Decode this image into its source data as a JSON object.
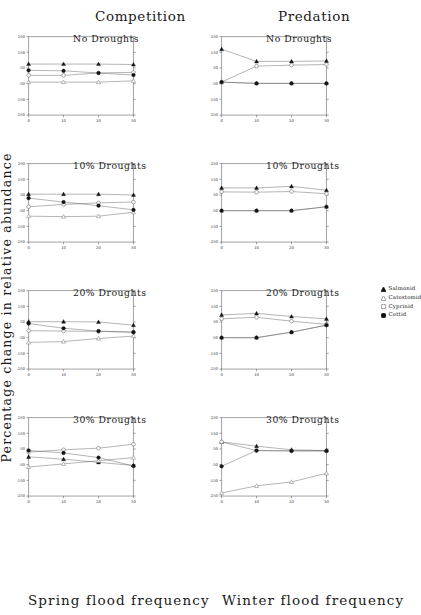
{
  "figure": {
    "ylabel": "Percentage change in relative abundance",
    "columns": [
      {
        "title": "Competition",
        "xlabel": "Spring flood frequency"
      },
      {
        "title": "Predation",
        "xlabel": "Winter flood frequency"
      }
    ],
    "row_titles": [
      "No Droughts",
      "10% Droughts",
      "20% Droughts",
      "30% Droughts"
    ],
    "yticks": [
      "250",
      "150",
      "50",
      "-50",
      "-150",
      "-250"
    ],
    "xticks": [
      "0",
      "10",
      "20",
      "30"
    ],
    "legend": [
      {
        "label": "Salmonid",
        "marker": "filled-triangle"
      },
      {
        "label": "Catostomid",
        "marker": "open-triangle"
      },
      {
        "label": "Cyprinid",
        "marker": "open-circle"
      },
      {
        "label": "Cottid",
        "marker": "filled-circle"
      }
    ]
  },
  "chart_data": {
    "type": "line",
    "xlabel": "Flood frequency",
    "ylabel": "Percentage change in relative abundance",
    "x": [
      0,
      10,
      20,
      30
    ],
    "xlim": [
      0,
      30
    ],
    "ylim": [
      -250,
      250
    ],
    "yticks": [
      250,
      150,
      50,
      -50,
      -150,
      -250
    ],
    "xticks": [
      0,
      10,
      20,
      30
    ],
    "grid": false,
    "legend_position": "right",
    "panels": [
      {
        "column": "Competition",
        "row": "No Droughts",
        "xlabel": "Spring flood frequency",
        "series": [
          {
            "name": "Salmonid",
            "values": [
              75,
              75,
              75,
              72
            ]
          },
          {
            "name": "Catostomid",
            "values": [
              -40,
              -40,
              -40,
              -32
            ]
          },
          {
            "name": "Cyprinid",
            "values": [
              3,
              3,
              18,
              22
            ]
          },
          {
            "name": "Cottid",
            "values": [
              35,
              32,
              18,
              5
            ]
          }
        ]
      },
      {
        "column": "Competition",
        "row": "10% Droughts",
        "xlabel": "Spring flood frequency",
        "series": [
          {
            "name": "Salmonid",
            "values": [
              55,
              55,
              55,
              50
            ]
          },
          {
            "name": "Catostomid",
            "values": [
              -85,
              -88,
              -85,
              -60
            ]
          },
          {
            "name": "Cyprinid",
            "values": [
              -25,
              -10,
              0,
              5
            ]
          },
          {
            "name": "Cottid",
            "values": [
              30,
              5,
              -18,
              -45
            ]
          }
        ]
      },
      {
        "column": "Competition",
        "row": "20% Droughts",
        "xlabel": "Spring flood frequency",
        "series": [
          {
            "name": "Salmonid",
            "values": [
              52,
              52,
              50,
              30
            ]
          },
          {
            "name": "Catostomid",
            "values": [
              -80,
              -75,
              -55,
              -40
            ]
          },
          {
            "name": "Cyprinid",
            "values": [
              -5,
              -8,
              -10,
              -15
            ]
          },
          {
            "name": "Cottid",
            "values": [
              40,
              10,
              -8,
              -15
            ]
          }
        ]
      },
      {
        "column": "Competition",
        "row": "30% Droughts",
        "xlabel": "Spring flood frequency",
        "series": [
          {
            "name": "Salmonid",
            "values": [
              0,
              -15,
              -35,
              -55
            ]
          },
          {
            "name": "Catostomid",
            "values": [
              -65,
              -45,
              -25,
              -5
            ]
          },
          {
            "name": "Cyprinid",
            "values": [
              30,
              45,
              55,
              80
            ]
          },
          {
            "name": "Cottid",
            "values": [
              40,
              25,
              -5,
              -58
            ]
          }
        ]
      },
      {
        "column": "Predation",
        "row": "No Droughts",
        "xlabel": "Winter flood frequency",
        "series": [
          {
            "name": "Salmonid",
            "values": [
              170,
              92,
              92,
              95
            ]
          },
          {
            "name": "Catostomid",
            "values": [
              -40,
              -48,
              -48,
              -48
            ]
          },
          {
            "name": "Cyprinid",
            "values": [
              -40,
              62,
              68,
              72
            ]
          },
          {
            "name": "Cottid",
            "values": [
              -40,
              -48,
              -48,
              -48
            ]
          }
        ]
      },
      {
        "column": "Predation",
        "row": "10% Droughts",
        "xlabil": "Winter flood frequency",
        "xlabel": "Winter flood frequency",
        "series": [
          {
            "name": "Salmonid",
            "values": [
              95,
              95,
              105,
              80
            ]
          },
          {
            "name": "Catostomid",
            "values": [
              -50,
              -50,
              -50,
              -25
            ]
          },
          {
            "name": "Cyprinid",
            "values": [
              70,
              68,
              72,
              58
            ]
          },
          {
            "name": "Cottid",
            "values": [
              -50,
              -50,
              -50,
              -25
            ]
          }
        ]
      },
      {
        "column": "Predation",
        "row": "20% Droughts",
        "xlabel": "Winter flood frequency",
        "series": [
          {
            "name": "Salmonid",
            "values": [
              95,
              105,
              85,
              70
            ]
          },
          {
            "name": "Catostomid",
            "values": [
              -50,
              -50,
              -15,
              30
            ]
          },
          {
            "name": "Cyprinid",
            "values": [
              70,
              80,
              55,
              35
            ]
          },
          {
            "name": "Cottid",
            "values": [
              -50,
              -50,
              -15,
              30
            ]
          }
        ]
      },
      {
        "column": "Predation",
        "row": "30% Droughts",
        "xlabel": "Winter flood frequency",
        "series": [
          {
            "name": "Salmonid",
            "values": [
              95,
              68,
              45,
              40
            ]
          },
          {
            "name": "Catostomid",
            "values": [
              -230,
              -185,
              -160,
              -105
            ]
          },
          {
            "name": "Cyprinid",
            "values": [
              95,
              40,
              38,
              38
            ]
          },
          {
            "name": "Cottid",
            "values": [
              -60,
              40,
              38,
              38
            ]
          }
        ]
      }
    ]
  }
}
